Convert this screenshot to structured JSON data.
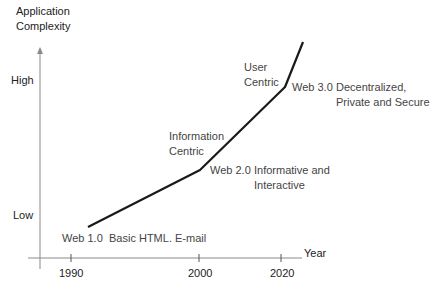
{
  "diagram": {
    "y_axis": {
      "title_line1": "Application",
      "title_line2": "Complexity",
      "high_label": "High",
      "low_label": "Low"
    },
    "x_axis": {
      "title": "Year",
      "ticks": [
        "1990",
        "2000",
        "2020"
      ]
    },
    "stages": [
      {
        "name": "Web 1.0",
        "description": "Basic HTML. E-mail"
      },
      {
        "name": "Web 2.0",
        "description_line1": "Informative and",
        "description_line2": "Interactive",
        "transition_line1": "Information",
        "transition_line2": "Centric"
      },
      {
        "name": "Web 3.0",
        "description_line1": "Decentralized,",
        "description_line2": "Private and Secure",
        "transition_line1": "User",
        "transition_line2": "Centric"
      }
    ],
    "colors": {
      "axis": "#808080",
      "curve": "#1a1a1a",
      "text": "#444444"
    },
    "curve_points": [
      [
        88,
        227
      ],
      [
        200,
        170
      ],
      [
        285,
        87
      ],
      [
        303,
        42
      ]
    ]
  }
}
